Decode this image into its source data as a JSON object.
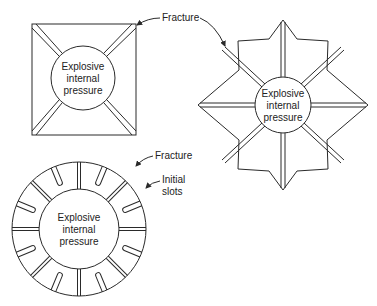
{
  "figure": {
    "square": {
      "center_label": [
        "Explosive",
        "internal",
        "pressure"
      ]
    },
    "star": {
      "center_label": [
        "Explosive",
        "internal",
        "pressure"
      ]
    },
    "ring": {
      "center_label": [
        "Explosive",
        "internal",
        "pressure"
      ]
    },
    "annotations": {
      "fracture_top": "Fracture",
      "fracture_ring": "Fracture",
      "initial_slots_line1": "Initial",
      "initial_slots_line2": "slots"
    }
  }
}
